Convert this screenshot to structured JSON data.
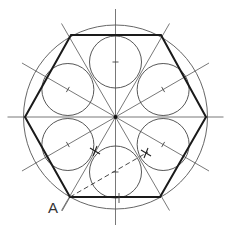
{
  "diagram": {
    "center": {
      "x": 115.5,
      "y": 117
    },
    "outer_circle": {
      "r": 92
    },
    "hexagon": {
      "vertices": [
        [
          206,
          117
        ],
        [
          161,
          35
        ],
        [
          71,
          35
        ],
        [
          25,
          117
        ],
        [
          70,
          197
        ],
        [
          160,
          197
        ]
      ]
    },
    "inner_circles": {
      "offset": 55,
      "r": 26,
      "angles_deg": [
        90,
        30,
        150,
        210,
        270,
        330
      ]
    },
    "construction_lines": {
      "axes_angles_deg": [
        0,
        30,
        60,
        90,
        120,
        150
      ],
      "length": 108
    },
    "dashed_line": {
      "from": [
        70,
        197
      ],
      "to": [
        148,
        152
      ]
    },
    "cross_marks": [
      [
        146,
        153
      ],
      [
        95,
        151
      ]
    ],
    "labels": {
      "vertex_a": "A"
    },
    "colors": {
      "stroke": "#222222",
      "thin": "#555555",
      "background": "#ffffff"
    }
  }
}
